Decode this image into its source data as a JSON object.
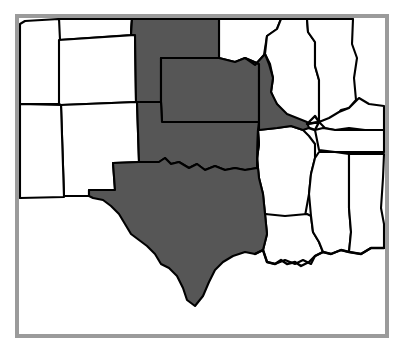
{
  "map": {
    "title": "South Central United States region map",
    "type": "choropleth-region-map",
    "frame": {
      "border_color": "#9b9b9b",
      "background_color": "#ffffff"
    },
    "legend": {
      "selected_color": "#565656",
      "unselected_color": "#ffffff",
      "outline_color": "#000000"
    },
    "selected_label": "",
    "states": [
      {
        "code": "TX",
        "name": "Texas",
        "selected": true
      },
      {
        "code": "OK",
        "name": "Oklahoma",
        "selected": true
      },
      {
        "code": "KS",
        "name": "Kansas",
        "selected": true
      },
      {
        "code": "NE",
        "name": "Nebraska",
        "selected": true
      },
      {
        "code": "MO",
        "name": "Missouri",
        "selected": true
      },
      {
        "code": "CO",
        "name": "Colorado",
        "selected": false
      },
      {
        "code": "NM",
        "name": "New Mexico",
        "selected": false
      },
      {
        "code": "AZ",
        "name": "Arizona",
        "selected": false
      },
      {
        "code": "UT",
        "name": "Utah",
        "selected": false
      },
      {
        "code": "WY",
        "name": "Wyoming",
        "selected": false
      },
      {
        "code": "SD",
        "name": "South Dakota",
        "selected": false
      },
      {
        "code": "IA",
        "name": "Iowa",
        "selected": false
      },
      {
        "code": "IL",
        "name": "Illinois",
        "selected": false
      },
      {
        "code": "IN",
        "name": "Indiana",
        "selected": false
      },
      {
        "code": "KY",
        "name": "Kentucky",
        "selected": false
      },
      {
        "code": "TN",
        "name": "Tennessee",
        "selected": false
      },
      {
        "code": "AR",
        "name": "Arkansas",
        "selected": false
      },
      {
        "code": "LA",
        "name": "Louisiana",
        "selected": false
      },
      {
        "code": "MS",
        "name": "Mississippi",
        "selected": false
      },
      {
        "code": "AL",
        "name": "Alabama",
        "selected": false
      }
    ]
  }
}
